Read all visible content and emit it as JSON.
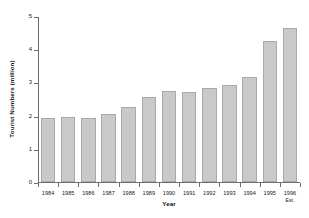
{
  "chart_data": {
    "type": "bar",
    "title": "",
    "xlabel": "Year",
    "ylabel": "Tourist Numbers (million)",
    "categories": [
      "1984",
      "1985",
      "1986",
      "1987",
      "1988",
      "1989",
      "1990",
      "1991",
      "1992",
      "1993",
      "1994",
      "1995",
      "1996"
    ],
    "category_sublabels": [
      "",
      "",
      "",
      "",
      "",
      "",
      "",
      "",
      "",
      "",
      "",
      "",
      "Est."
    ],
    "values": [
      1.93,
      1.95,
      1.92,
      2.05,
      2.25,
      2.55,
      2.75,
      2.72,
      2.82,
      2.92,
      3.15,
      4.25,
      4.64
    ],
    "yticks": [
      0,
      1,
      2,
      3,
      4,
      5
    ],
    "ytick_labels": [
      "0",
      "1",
      "2",
      "3",
      "4",
      "5"
    ],
    "ylim": [
      0,
      5
    ],
    "grid": false,
    "legend": null,
    "bar_color": "#c9c9c9",
    "bar_edge_color": "#a9a9a9",
    "axis_color": "#6e6e6e"
  }
}
